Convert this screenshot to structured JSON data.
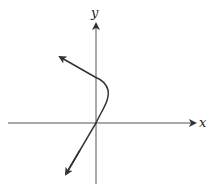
{
  "diagram": {
    "axes": {
      "x_label": "x",
      "y_label": "y"
    },
    "curve": {
      "description": "Curve through origin, rising to upper-right then bending back to upper-left; arrows on both ends",
      "color": "#333333"
    },
    "colors": {
      "axis": "#333333",
      "background": "#ffffff"
    }
  }
}
